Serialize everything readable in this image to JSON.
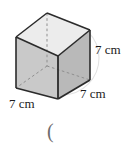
{
  "figure": {
    "shape_name": "cube",
    "labels": {
      "height": "7 cm",
      "depth": "7 cm",
      "width": "7 cm"
    },
    "stray_character": "(",
    "colors": {
      "edge": "#2b2b2b",
      "hidden_edge": "#8a8a8a",
      "top_face": "#e8e8e8",
      "left_face": "#c9c9c9",
      "right_face": "#b9b9b9",
      "background_arc": "#e3e3e3",
      "text": "#1b1b1b",
      "stray_text": "#6d6d6d",
      "page_background": "#ffffff"
    },
    "geometry": {
      "front_top": [
        58,
        56
      ],
      "front_bottom": [
        58,
        99
      ],
      "left_top": [
        16,
        37
      ],
      "left_bottom": [
        16,
        88
      ],
      "right_top": [
        90,
        30
      ],
      "right_bottom": [
        90,
        80
      ],
      "back_top": [
        47,
        13
      ],
      "back_bottom_hidden": [
        47,
        66
      ]
    }
  }
}
